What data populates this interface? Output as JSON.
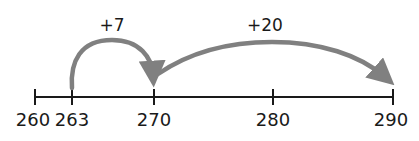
{
  "number_line": {
    "axis_color": "#1a1a1a",
    "ticks": [
      {
        "value": 260,
        "label": "260",
        "x": 35
      },
      {
        "value": 263,
        "label": "263",
        "x": 72
      },
      {
        "value": 270,
        "label": "270",
        "x": 154
      },
      {
        "value": 280,
        "label": "280",
        "x": 273
      },
      {
        "value": 290,
        "label": "290",
        "x": 393
      }
    ]
  },
  "jumps": [
    {
      "label": "+7",
      "from": 263,
      "to": 270
    },
    {
      "label": "+20",
      "from": 270,
      "to": 290
    }
  ],
  "arc_color": "#808080"
}
